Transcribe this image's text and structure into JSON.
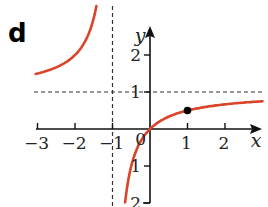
{
  "panel": {
    "label": "d"
  },
  "chart_data": {
    "type": "line",
    "title": "",
    "function": "y = x/(x+1)",
    "xlabel": "x",
    "ylabel": "y",
    "xlim": [
      -3.9,
      3.1
    ],
    "ylim": [
      -2.0,
      3.4
    ],
    "x_ticks": [
      -3,
      -2,
      -1,
      1,
      2
    ],
    "x_tick_labels": [
      "−3",
      "−2",
      "−1",
      "1",
      "2"
    ],
    "y_ticks": [
      2,
      1,
      -1,
      -2
    ],
    "y_tick_labels": [
      "2",
      "1",
      "1",
      "2"
    ],
    "origin_label": "0",
    "asymptotes": {
      "vertical": -1,
      "horizontal": 1,
      "style": "dashed"
    },
    "series": [
      {
        "name": "left branch",
        "x": [
          -3.6,
          -3,
          -2.5,
          -2,
          -1.7,
          -1.5,
          -1.4
        ],
        "y": [
          1.38,
          1.5,
          1.67,
          2.0,
          2.43,
          3.0,
          3.5
        ],
        "color": "#d9442a"
      },
      {
        "name": "right branch",
        "x": [
          -0.67,
          -0.5,
          -0.25,
          0,
          0.5,
          1,
          1.5,
          2,
          2.5,
          3
        ],
        "y": [
          -2.0,
          -1.0,
          -0.33,
          0,
          0.33,
          0.5,
          0.6,
          0.67,
          0.71,
          0.75
        ],
        "color": "#d9442a"
      }
    ],
    "points": [
      {
        "x": 1,
        "y": 0.5,
        "marker": "filled-circle",
        "color": "#000000"
      }
    ],
    "grid": false,
    "legend": null
  }
}
